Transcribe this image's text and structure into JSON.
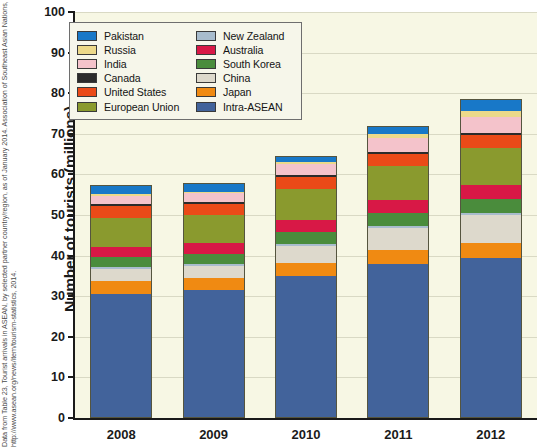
{
  "attribution": "Data from Table 23, Tourist arrivals in ASEAN, by selected partner country/region, as of January 2014. Association of Southeast Asian Nations, http://www.asean.org/news/item/tourism-statistics, 2014.",
  "axis": {
    "ylabel": "Number of tourists (millions)",
    "yticks": [
      "0",
      "10",
      "20",
      "30",
      "40",
      "50",
      "60",
      "70",
      "80",
      "90",
      "100"
    ],
    "ymin": 0,
    "ymax": 100,
    "xticks": [
      "2008",
      "2009",
      "2010",
      "2011",
      "2012"
    ]
  },
  "legend": {
    "column_left": [
      {
        "label": "Pakistan",
        "color": "#1878c8"
      },
      {
        "label": "Russia",
        "color": "#ecd98a"
      },
      {
        "label": "India",
        "color": "#f4c3cb"
      },
      {
        "label": "Canada",
        "color": "#2b2b2b"
      },
      {
        "label": "United States",
        "color": "#ea4a18"
      },
      {
        "label": "European Union",
        "color": "#8a9a2e"
      }
    ],
    "column_right": [
      {
        "label": "New Zealand",
        "color": "#a8bccd"
      },
      {
        "label": "Australia",
        "color": "#d81846"
      },
      {
        "label": "South Korea",
        "color": "#4a8c3c"
      },
      {
        "label": "China",
        "color": "#ddd9cc"
      },
      {
        "label": "Japan",
        "color": "#f08a12"
      },
      {
        "label": "Intra-ASEAN",
        "color": "#42639b"
      }
    ]
  },
  "chart_data": {
    "type": "bar",
    "stacked": true,
    "title": "",
    "xlabel": "",
    "ylabel": "Number of tourists (millions)",
    "ylim": [
      0,
      100
    ],
    "ytick_step": 10,
    "grid": true,
    "legend_position": "upper-left-inside",
    "categories": [
      "2008",
      "2009",
      "2010",
      "2011",
      "2012"
    ],
    "series": [
      {
        "name": "Intra-ASEAN",
        "color": "#42639b",
        "values": [
          30.5,
          31.5,
          35.0,
          38.0,
          39.5
        ]
      },
      {
        "name": "Japan",
        "color": "#f08a12",
        "values": [
          3.2,
          3.0,
          3.3,
          3.3,
          3.6
        ]
      },
      {
        "name": "China",
        "color": "#ddd9cc",
        "values": [
          3.0,
          3.0,
          4.2,
          5.5,
          6.9
        ]
      },
      {
        "name": "New Zealand",
        "color": "#a8bccd",
        "values": [
          0.5,
          0.5,
          0.5,
          0.5,
          0.5
        ]
      },
      {
        "name": "South Korea",
        "color": "#4a8c3c",
        "values": [
          2.6,
          2.6,
          3.0,
          3.3,
          3.6
        ]
      },
      {
        "name": "Australia",
        "color": "#d81846",
        "values": [
          2.5,
          2.6,
          3.0,
          3.3,
          3.5
        ]
      },
      {
        "name": "European Union",
        "color": "#8a9a2e",
        "values": [
          7.2,
          7.0,
          7.6,
          8.3,
          9.0
        ]
      },
      {
        "name": "United States",
        "color": "#ea4a18",
        "values": [
          2.8,
          2.7,
          2.9,
          3.0,
          3.2
        ]
      },
      {
        "name": "Canada",
        "color": "#2b2b2b",
        "values": [
          0.5,
          0.5,
          0.5,
          0.5,
          0.5
        ]
      },
      {
        "name": "India",
        "color": "#f4c3cb",
        "values": [
          2.1,
          2.2,
          2.9,
          3.6,
          4.0
        ]
      },
      {
        "name": "Russia",
        "color": "#ecd98a",
        "values": [
          0.5,
          0.3,
          0.5,
          1.0,
          1.5
        ]
      },
      {
        "name": "Pakistan",
        "color": "#1878c8",
        "values": [
          2.1,
          2.1,
          1.1,
          1.7,
          2.7
        ]
      }
    ],
    "totals": [
      57.5,
      58.0,
      64.5,
      72.0,
      78.5
    ]
  }
}
